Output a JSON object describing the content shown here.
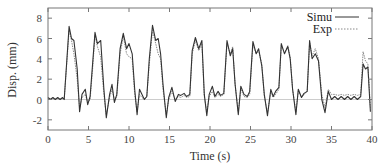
{
  "chart_data": {
    "type": "line",
    "title": "",
    "xlabel": "Time (s)",
    "ylabel": "Disp. (mm)",
    "xlim": [
      0,
      40
    ],
    "ylim": [
      -3,
      9
    ],
    "xticks": [
      0,
      5,
      10,
      15,
      20,
      25,
      30,
      35,
      40
    ],
    "yticks": [
      -2,
      0,
      2,
      4,
      6,
      8
    ],
    "grid": false,
    "zero_reference_line": true,
    "legend_position": "upper right",
    "legend": [
      "Simu",
      "Exp"
    ],
    "series": [
      {
        "name": "Simu",
        "style": "solid",
        "color": "#333333",
        "x": [
          0,
          0.3,
          0.6,
          0.9,
          1.2,
          1.5,
          1.8,
          2.0,
          2.6,
          2.9,
          3.2,
          3.6,
          3.9,
          4.2,
          4.6,
          4.9,
          5.2,
          5.5,
          5.8,
          6.1,
          6.5,
          6.9,
          7.2,
          7.6,
          7.9,
          8.2,
          8.5,
          8.9,
          9.3,
          9.7,
          10.0,
          10.4,
          10.7,
          11.0,
          11.3,
          11.6,
          11.9,
          12.2,
          12.5,
          12.9,
          13.3,
          13.6,
          13.9,
          14.2,
          14.6,
          14.9,
          15.3,
          15.7,
          16.1,
          16.4,
          16.8,
          17.1,
          17.5,
          17.8,
          18.2,
          18.6,
          19.0,
          19.3,
          19.6,
          19.9,
          20.3,
          20.6,
          21.0,
          21.3,
          21.7,
          22.1,
          22.5,
          22.8,
          23.1,
          23.5,
          23.8,
          24.2,
          24.6,
          24.9,
          25.3,
          25.7,
          26.0,
          26.4,
          26.7,
          27.1,
          27.5,
          27.8,
          28.1,
          28.5,
          28.8,
          29.2,
          29.6,
          29.9,
          30.2,
          30.6,
          30.9,
          31.3,
          31.6,
          32.0,
          32.3,
          32.6,
          33.0,
          33.4,
          33.8,
          34.2,
          34.6,
          35.0,
          35.4,
          35.8,
          36.2,
          36.6,
          37.0,
          37.4,
          37.8,
          38.2,
          38.6,
          38.9,
          39.2,
          39.5,
          39.8
        ],
        "y": [
          0.2,
          0.0,
          0.2,
          0.0,
          0.2,
          0.0,
          0.2,
          0.0,
          7.2,
          6.0,
          5.8,
          3.0,
          -1.2,
          0.5,
          1.0,
          -0.5,
          0.3,
          3.5,
          6.6,
          5.5,
          5.8,
          1.0,
          -1.8,
          0.5,
          1.5,
          -0.3,
          0.5,
          5.0,
          6.5,
          5.0,
          5.5,
          4.5,
          1.0,
          -1.5,
          1.0,
          0.5,
          0.0,
          0.3,
          4.0,
          7.3,
          5.8,
          6.0,
          4.5,
          1.5,
          -1.8,
          0.2,
          1.2,
          -0.2,
          0.5,
          0.4,
          0.6,
          0.3,
          0.5,
          4.8,
          6.1,
          5.0,
          5.8,
          0.5,
          -1.6,
          0.5,
          1.3,
          0.3,
          0.8,
          0.4,
          0.6,
          5.8,
          4.3,
          5.0,
          1.5,
          -1.5,
          1.3,
          0.5,
          0.3,
          0.8,
          5.7,
          4.5,
          5.0,
          3.3,
          0.5,
          -1.6,
          1.0,
          0.3,
          0.8,
          1.2,
          5.5,
          4.5,
          5.2,
          4.0,
          1.0,
          -1.5,
          1.0,
          0.2,
          0.6,
          0.8,
          5.8,
          4.0,
          4.5,
          3.8,
          0.0,
          -1.3,
          0.8,
          0.0,
          0.3,
          0.0,
          0.3,
          0.0,
          0.3,
          0.0,
          0.3,
          0.0,
          0.3,
          3.5,
          3.0,
          3.2,
          -1.2
        ]
      },
      {
        "name": "Exp",
        "style": "dotted",
        "color": "#888888",
        "x": [
          0,
          0.3,
          0.6,
          0.9,
          1.2,
          1.5,
          1.8,
          2.0,
          2.6,
          2.9,
          3.2,
          3.6,
          3.9,
          4.2,
          4.6,
          4.9,
          5.2,
          5.5,
          5.8,
          6.1,
          6.5,
          6.9,
          7.2,
          7.6,
          7.9,
          8.2,
          8.5,
          8.9,
          9.3,
          9.7,
          10.0,
          10.4,
          10.7,
          11.0,
          11.3,
          11.6,
          11.9,
          12.2,
          12.5,
          12.9,
          13.3,
          13.6,
          13.9,
          14.2,
          14.6,
          14.9,
          15.3,
          15.7,
          16.1,
          16.4,
          16.8,
          17.1,
          17.5,
          17.8,
          18.2,
          18.6,
          19.0,
          19.3,
          19.6,
          19.9,
          20.3,
          20.6,
          21.0,
          21.3,
          21.7,
          22.1,
          22.5,
          22.8,
          23.1,
          23.5,
          23.8,
          24.2,
          24.6,
          24.9,
          25.3,
          25.7,
          26.0,
          26.4,
          26.7,
          27.1,
          27.5,
          27.8,
          28.1,
          28.5,
          28.8,
          29.2,
          29.6,
          29.9,
          30.2,
          30.6,
          30.9,
          31.3,
          31.6,
          32.0,
          32.3,
          32.6,
          33.0,
          33.4,
          33.8,
          34.2,
          34.6,
          35.0,
          35.4,
          35.8,
          36.2,
          36.6,
          37.0,
          37.4,
          37.8,
          38.2,
          38.6,
          38.9,
          39.2,
          39.5,
          39.8
        ],
        "y": [
          0.1,
          0.0,
          0.1,
          0.0,
          0.1,
          0.0,
          0.1,
          0.0,
          6.8,
          5.8,
          4.5,
          2.0,
          -0.8,
          0.2,
          0.5,
          -0.3,
          0.0,
          3.0,
          6.3,
          5.2,
          4.2,
          0.5,
          -1.5,
          0.2,
          1.0,
          0.0,
          0.3,
          4.5,
          6.2,
          4.5,
          4.2,
          4.0,
          0.5,
          -1.2,
          0.5,
          0.2,
          0.0,
          0.3,
          3.5,
          6.8,
          5.5,
          4.5,
          4.0,
          1.0,
          -1.5,
          0.0,
          0.8,
          0.0,
          0.3,
          0.2,
          0.4,
          0.2,
          0.3,
          4.5,
          5.8,
          4.8,
          5.5,
          0.3,
          -1.2,
          0.3,
          0.8,
          0.2,
          0.5,
          0.3,
          0.5,
          5.5,
          4.5,
          5.2,
          1.5,
          -1.2,
          1.0,
          0.3,
          0.2,
          0.5,
          5.4,
          4.5,
          4.8,
          3.5,
          0.3,
          -1.3,
          0.8,
          0.2,
          0.5,
          1.0,
          5.3,
          4.6,
          5.3,
          4.2,
          1.0,
          -1.2,
          0.8,
          0.2,
          0.5,
          0.8,
          5.6,
          4.3,
          5.0,
          4.0,
          0.5,
          -0.8,
          1.0,
          0.5,
          0.5,
          0.4,
          0.5,
          0.4,
          0.5,
          0.4,
          0.5,
          0.4,
          0.5,
          4.7,
          3.8,
          3.5,
          -0.8
        ]
      }
    ]
  },
  "colors": {
    "axes": "#777777",
    "zero_line": "#cccccc",
    "simu": "#333333",
    "exp": "#888888"
  }
}
